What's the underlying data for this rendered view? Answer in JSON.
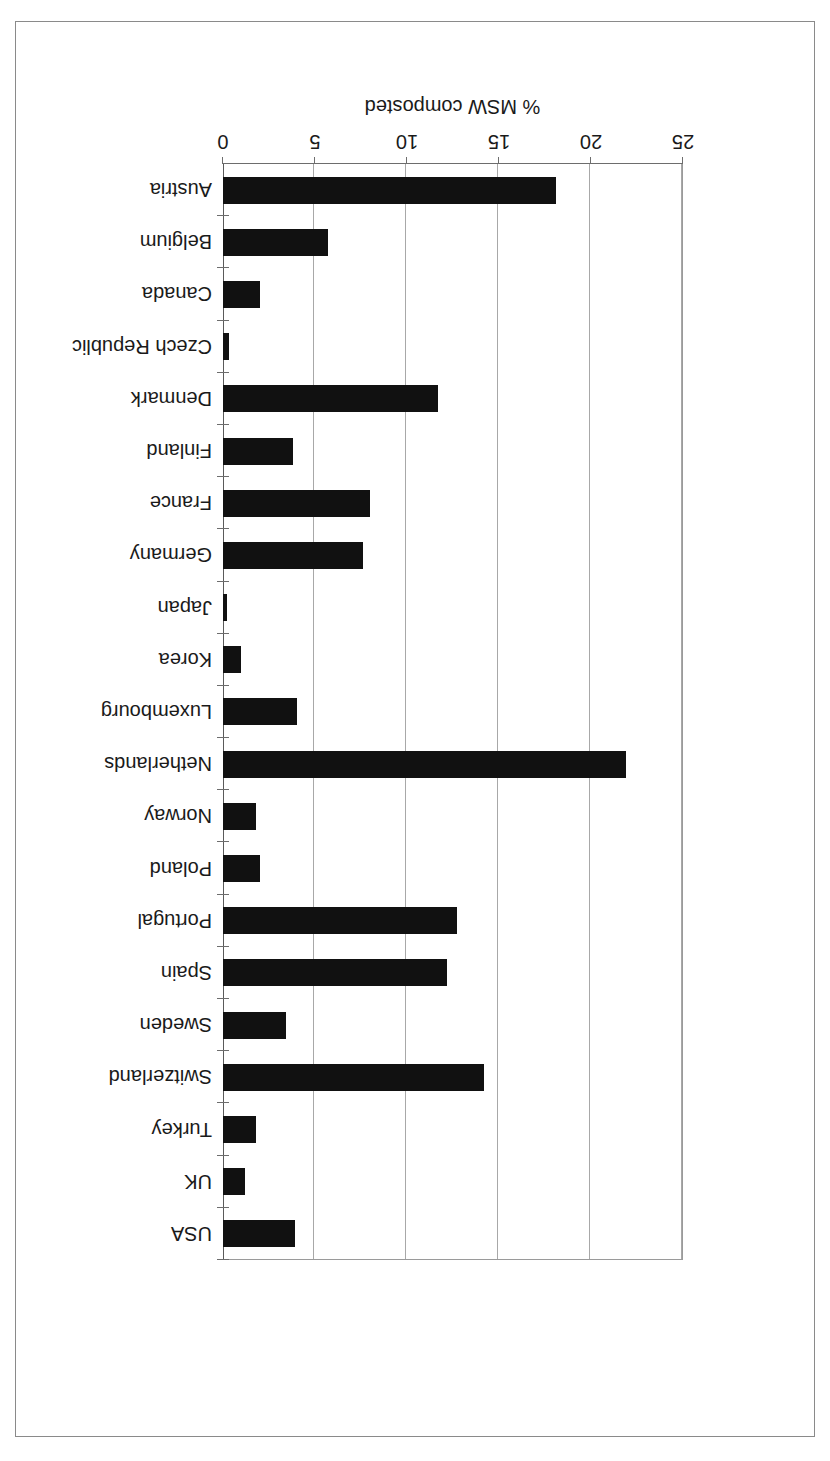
{
  "chart_data": {
    "type": "bar",
    "orientation": "horizontal",
    "title": "",
    "subtitle": "",
    "xlabel": "% MSW composted",
    "ylabel": "",
    "xlim": [
      0,
      25
    ],
    "xticks": [
      0,
      5,
      10,
      15,
      20,
      25
    ],
    "xtick_labels": [
      "0",
      "5",
      "10",
      "15",
      "20",
      "25"
    ],
    "grid": true,
    "grid_axis": "x",
    "legend": null,
    "legend_position": "none",
    "rotated_180": true,
    "bar_color": "#111111",
    "axis_color": "#6d6d6d",
    "grid_color": "#a8a8a8",
    "categories": [
      "Austria",
      "Belgium",
      "Canada",
      "Czech Republic",
      "Denmark",
      "Finland",
      "France",
      "Germany",
      "Japan",
      "Korea",
      "Luxembourg",
      "Netherlands",
      "Norway",
      "Poland",
      "Portugal",
      "Spain",
      "Sweden",
      "Switzerland",
      "Turkey",
      "UK",
      "USA"
    ],
    "values": [
      18.1,
      5.7,
      2.0,
      0.3,
      11.7,
      3.8,
      8.0,
      7.6,
      0.2,
      1.0,
      4.0,
      21.9,
      1.8,
      2.0,
      12.7,
      12.2,
      3.4,
      14.2,
      1.8,
      1.2,
      3.9
    ]
  }
}
